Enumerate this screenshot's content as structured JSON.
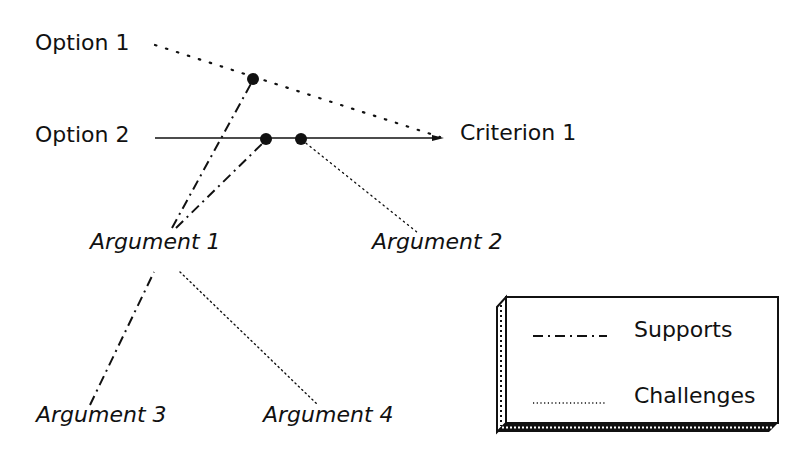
{
  "diagram": {
    "nodes": {
      "option1": {
        "label": "Option 1"
      },
      "option2": {
        "label": "Option 2"
      },
      "criterion1": {
        "label": "Criterion 1"
      },
      "argument1": {
        "label": "Argument 1"
      },
      "argument2": {
        "label": "Argument 2"
      },
      "argument3": {
        "label": "Argument 3"
      },
      "argument4": {
        "label": "Argument 4"
      }
    },
    "edges": [
      {
        "from": "Option 1",
        "to": "Criterion 1",
        "style": "dotted"
      },
      {
        "from": "Option 2",
        "to": "Criterion 1",
        "style": "solid"
      },
      {
        "from": "Argument 1",
        "to": "Option 1–Criterion 1 link",
        "style": "dash-dot",
        "relation": "Supports"
      },
      {
        "from": "Argument 1",
        "to": "Option 2–Criterion 1 link",
        "style": "dash-dot",
        "relation": "Supports"
      },
      {
        "from": "Argument 2",
        "to": "Option 2–Criterion 1 link",
        "style": "dotted",
        "relation": "Challenges"
      },
      {
        "from": "Argument 3",
        "to": "Argument 1",
        "style": "dash-dot",
        "relation": "Supports"
      },
      {
        "from": "Argument 4",
        "to": "Argument 1",
        "style": "dotted",
        "relation": "Challenges"
      }
    ],
    "legend": {
      "supports": {
        "label": "Supports",
        "line_style": "dash-dot"
      },
      "challenges": {
        "label": "Challenges",
        "line_style": "dotted"
      }
    },
    "colors": {
      "ink": "#111111",
      "background": "#ffffff"
    }
  }
}
